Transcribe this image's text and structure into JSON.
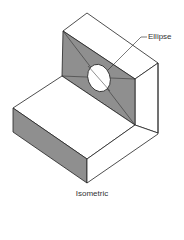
{
  "figure": {
    "caption": "Isometric",
    "callout_label": "Ellipse",
    "colors": {
      "shade": "#8f8f8f",
      "line": "#222222",
      "face": "#ffffff"
    }
  }
}
